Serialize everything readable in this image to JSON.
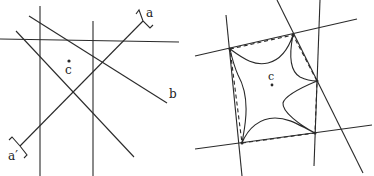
{
  "left_diagram": {
    "lines": [
      {
        "name": "vertical-line-1",
        "x1": 40,
        "y1": 6,
        "x2": 40,
        "y2": 176
      },
      {
        "name": "vertical-line-2",
        "x1": 93,
        "y1": 21,
        "x2": 93,
        "y2": 176
      },
      {
        "name": "horizontal-line",
        "x1": 0,
        "y1": 39,
        "x2": 179,
        "y2": 42
      },
      {
        "name": "line-b",
        "x1": 29,
        "y1": 16,
        "x2": 167,
        "y2": 103
      },
      {
        "name": "diagonal-line",
        "x1": 16,
        "y1": 31,
        "x2": 134,
        "y2": 157
      },
      {
        "name": "line-a-a-prime",
        "x1": 143,
        "y1": 21,
        "x2": 20,
        "y2": 146
      }
    ],
    "brackets": [
      {
        "name": "bracket-a",
        "d": "M136 14 L139 10 L143 21 L150 28 L153 25"
      },
      {
        "name": "bracket-a-prime",
        "d": "M9 140 L12 137 L20 146 L27 155 L24 158"
      }
    ],
    "point_c": {
      "x": 69,
      "y": 61,
      "r": 1.6
    },
    "labels": [
      {
        "name": "label-a",
        "text": "a",
        "x": 146,
        "y": 17
      },
      {
        "name": "label-b",
        "text": "b",
        "x": 169,
        "y": 98
      },
      {
        "name": "label-c",
        "text": "c",
        "x": 65,
        "y": 74
      },
      {
        "name": "label-a-prime",
        "text": "a′",
        "x": 8,
        "y": 160
      }
    ]
  },
  "right_diagram": {
    "vertices": [
      {
        "name": "P1",
        "x": 230,
        "y": 49
      },
      {
        "name": "P2",
        "x": 293,
        "y": 35
      },
      {
        "name": "P3",
        "x": 317,
        "y": 81
      },
      {
        "name": "P4",
        "x": 315,
        "y": 133
      },
      {
        "name": "P5",
        "x": 242,
        "y": 143
      }
    ],
    "lines": [
      {
        "name": "top-line",
        "x1": 195,
        "y1": 56,
        "x2": 357,
        "y2": 19
      },
      {
        "name": "left-line",
        "x1": 226,
        "y1": 15,
        "x2": 242,
        "y2": 176
      },
      {
        "name": "slanted-right-line",
        "x1": 277,
        "y1": 0,
        "x2": 363,
        "y2": 173
      },
      {
        "name": "right-vertical-line",
        "x1": 320,
        "y1": 0,
        "x2": 314,
        "y2": 166
      },
      {
        "name": "bottom-line",
        "x1": 195,
        "y1": 149,
        "x2": 372,
        "y2": 125
      }
    ],
    "dashed_polygon": "230,49 293,35 317,81 315,133 242,143 230,49",
    "star_curve": "M230 49 C245 60 255 66 268 63 C280 60 288 50 293 35 C290 50 288 70 300 77 C308 81 312 81 317 81 C305 86 285 95 283 103 C282 112 300 125 315 133 C300 126 290 118 275 118 C260 118 248 128 242 143 C244 130 252 100 238 75 C234 66 232 58 230 49",
    "point_c": {
      "x": 272,
      "y": 85,
      "r": 1.4
    },
    "labels": [
      {
        "name": "label-c",
        "text": "c",
        "x": 268,
        "y": 80
      }
    ]
  },
  "colors": {
    "ink": "#2a2a2a",
    "background": "#ffffff"
  }
}
